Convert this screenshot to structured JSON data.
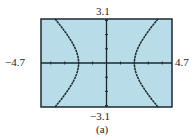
{
  "chart_data": {
    "type": "line",
    "title": "",
    "caption": "(a)",
    "window": {
      "xmin": -4.7,
      "xmax": 4.7,
      "ymin": -3.1,
      "ymax": 3.1,
      "xscl": 1,
      "yscl": 1
    },
    "labels": {
      "xmin": "−4.7",
      "xmax": "4.7",
      "ymin": "−3.1",
      "ymax": "3.1"
    },
    "xlim": [
      -4.7,
      4.7
    ],
    "ylim": [
      -3.1,
      3.1
    ],
    "grid": false,
    "series": [
      {
        "name": "right branch",
        "equation": "x = sqrt(4 + y^2)",
        "x": [
          3.69,
          3.2,
          2.83,
          2.5,
          2.24,
          2.06,
          2.0,
          2.06,
          2.24,
          2.5,
          2.83,
          3.2,
          3.69
        ],
        "y": [
          -3.1,
          -2.5,
          -2.0,
          -1.5,
          -1.0,
          -0.5,
          0,
          0.5,
          1.0,
          1.5,
          2.0,
          2.5,
          3.1
        ]
      },
      {
        "name": "left branch",
        "equation": "x = -sqrt(4 + y^2)",
        "x": [
          -3.69,
          -3.2,
          -2.83,
          -2.5,
          -2.24,
          -2.06,
          -2.0,
          -2.06,
          -2.24,
          -2.5,
          -2.83,
          -3.2,
          -3.69
        ],
        "y": [
          -3.1,
          -2.5,
          -2.0,
          -1.5,
          -1.0,
          -0.5,
          0,
          0.5,
          1.0,
          1.5,
          2.0,
          2.5,
          3.1
        ]
      }
    ],
    "colors": {
      "screen": "#b9dde8",
      "curve": "#1a2a30",
      "axes": "#1a2a30",
      "frame": "#1a2a30"
    }
  }
}
